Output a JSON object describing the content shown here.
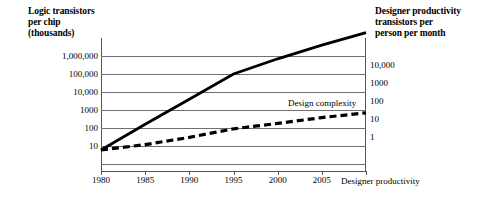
{
  "chart_data": {
    "type": "line",
    "title": "",
    "ylabel": "Logic transistors per chip (thousands)",
    "ylabel_right": "Designer productivity transistors per person per month",
    "xlabel": "",
    "x_ticks": [
      "1980",
      "1985",
      "1990",
      "1995",
      "2000",
      "2005",
      "2010"
    ],
    "xlim": [
      1980,
      2010
    ],
    "grid": true,
    "legend_position": "inline-labels",
    "y_ticks_left": [
      "1,000,000",
      "100,000",
      "10,000",
      "1000",
      "100",
      "10"
    ],
    "y_ticks_right": [
      "10,000",
      "1000",
      "100",
      "10",
      "1"
    ],
    "ylim_left_log": [
      1,
      10000000
    ],
    "ylim_right_log": [
      0.1,
      100000
    ],
    "series": [
      {
        "name": "Design complexity",
        "style": "solid",
        "color": "#000000",
        "x": [
          1980,
          1985,
          1990,
          1995,
          2000,
          2005,
          2010
        ],
        "values": [
          6,
          160,
          4000,
          100000,
          700000,
          4000000,
          20000000
        ]
      },
      {
        "name": "Designer productivity",
        "style": "dashed",
        "color": "#000000",
        "x": [
          1980,
          1985,
          1990,
          1995,
          2000,
          2005,
          2010
        ],
        "values": [
          6,
          12,
          30,
          90,
          180,
          380,
          700
        ]
      }
    ]
  },
  "left_axis": {
    "title": "Logic transistors\nper chip\n(thousands)",
    "ticks": [
      "1,000,000",
      "100,000",
      "10,000",
      "1000",
      "100",
      "10"
    ]
  },
  "right_axis": {
    "title": "Designer productivity\ntransistors per\nperson per month",
    "ticks": [
      "10,000",
      "1000",
      "100",
      "10",
      "1"
    ]
  },
  "x_axis": {
    "ticks": [
      "1980",
      "1985",
      "1990",
      "1995",
      "2000",
      "2005",
      "2010"
    ]
  },
  "series_labels": {
    "design_complexity": "Design complexity",
    "designer_productivity": "Designer productivity"
  }
}
